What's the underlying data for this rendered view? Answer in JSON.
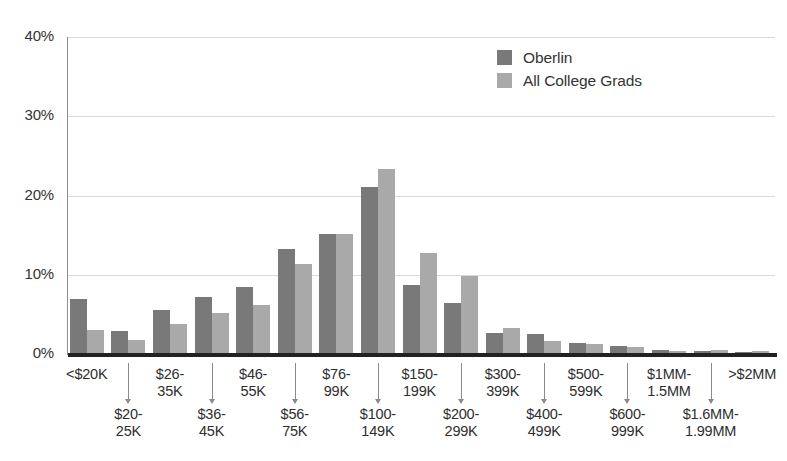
{
  "chart_data": {
    "type": "bar",
    "title": "",
    "subtitle": "",
    "xlabel": "",
    "ylabel": "",
    "ylim": [
      0,
      40
    ],
    "y_ticks": [
      "0%",
      "10%",
      "20%",
      "30%",
      "40%"
    ],
    "y_tick_values": [
      0,
      10,
      20,
      30,
      40
    ],
    "grid": true,
    "legend_position": "top-right",
    "categories": [
      "<$20K",
      "$20-25K",
      "$26-35K",
      "$36-45K",
      "$46-55K",
      "$56-75K",
      "$76-99K",
      "$100-149K",
      "$150-199K",
      "$200-299K",
      "$300-399K",
      "$400-499K",
      "$500-599K",
      "$600-999K",
      "$1MM-1.5MM",
      "$1.6MM-1.99MM",
      ">$2MM"
    ],
    "category_labels": [
      {
        "line1": "<$20K",
        "line2": "",
        "row": "top"
      },
      {
        "line1": "$20-",
        "line2": "25K",
        "row": "bottom"
      },
      {
        "line1": "$26-",
        "line2": "35K",
        "row": "top"
      },
      {
        "line1": "$36-",
        "line2": "45K",
        "row": "bottom"
      },
      {
        "line1": "$46-",
        "line2": "55K",
        "row": "top"
      },
      {
        "line1": "$56-",
        "line2": "75K",
        "row": "bottom"
      },
      {
        "line1": "$76-",
        "line2": "99K",
        "row": "top"
      },
      {
        "line1": "$100-",
        "line2": "149K",
        "row": "bottom"
      },
      {
        "line1": "$150-",
        "line2": "199K",
        "row": "top"
      },
      {
        "line1": "$200-",
        "line2": "299K",
        "row": "bottom"
      },
      {
        "line1": "$300-",
        "line2": "399K",
        "row": "top"
      },
      {
        "line1": "$400-",
        "line2": "499K",
        "row": "bottom"
      },
      {
        "line1": "$500-",
        "line2": "599K",
        "row": "top"
      },
      {
        "line1": "$600-",
        "line2": "999K",
        "row": "bottom"
      },
      {
        "line1": "$1MM-",
        "line2": "1.5MM",
        "row": "top"
      },
      {
        "line1": "$1.6MM-",
        "line2": "1.99MM",
        "row": "bottom"
      },
      {
        "line1": ">$2MM",
        "line2": "",
        "row": "top"
      }
    ],
    "series": [
      {
        "name": "Oberlin",
        "color": "#797979",
        "values": [
          7.0,
          2.9,
          5.5,
          7.2,
          8.4,
          13.2,
          15.1,
          21.1,
          8.7,
          6.5,
          2.7,
          2.5,
          1.4,
          1.0,
          0.5,
          0.4,
          0.3
        ]
      },
      {
        "name": "All College Grads",
        "color": "#a9a9a9",
        "values": [
          3.0,
          1.8,
          3.8,
          5.2,
          6.2,
          11.4,
          15.1,
          23.3,
          12.7,
          9.9,
          3.3,
          1.7,
          1.3,
          0.9,
          0.4,
          0.5,
          0.4
        ]
      }
    ]
  },
  "legend": {
    "items": [
      {
        "label": "Oberlin",
        "color": "#797979"
      },
      {
        "label": "All College Grads",
        "color": "#a9a9a9"
      }
    ]
  }
}
